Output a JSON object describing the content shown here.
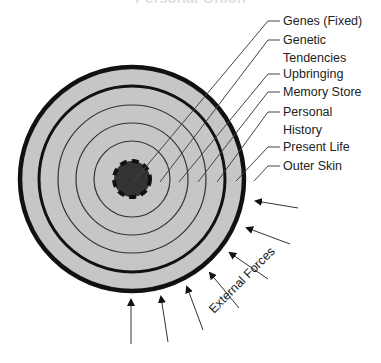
{
  "diagram": {
    "title": "Personal Onion",
    "colors": {
      "fill": "#c6c6c6",
      "stroke": "#111111",
      "core": "#333333",
      "text": "#222222",
      "leader": "#444444"
    },
    "layers": [
      {
        "label": "Genes (Fixed)",
        "label_lines": [
          "Genes (Fixed)"
        ],
        "radius": 18,
        "style": "core-dashed"
      },
      {
        "label": "Genetic Tendencies",
        "label_lines": [
          "Genetic",
          "Tendencies"
        ],
        "radius": 37,
        "style": "thin"
      },
      {
        "label": "Upbringing",
        "label_lines": [
          "Upbringing"
        ],
        "radius": 56,
        "style": "thin"
      },
      {
        "label": "Memory Store",
        "label_lines": [
          "Memory Store"
        ],
        "radius": 75,
        "style": "thin"
      },
      {
        "label": "Personal History",
        "label_lines": [
          "Personal",
          "History"
        ],
        "radius": 94,
        "style": "thick"
      },
      {
        "label": "Present Life",
        "label_lines": [
          "Present Life"
        ],
        "radius": 113,
        "style": "thick-outer"
      },
      {
        "label": "Outer Skin",
        "label_lines": [
          "Outer Skin"
        ],
        "radius": null,
        "style": "edge"
      }
    ],
    "labels": {
      "genes": "Genes (Fixed)",
      "genetic_1": "Genetic",
      "genetic_2": "Tendencies",
      "upbringing": "Upbringing",
      "memory": "Memory Store",
      "personal_1": "Personal",
      "personal_2": "History",
      "present": "Present Life",
      "outer": "Outer Skin",
      "external": "External Forces"
    },
    "external_forces": {
      "label": "External Forces",
      "arrow_count": 7
    }
  }
}
